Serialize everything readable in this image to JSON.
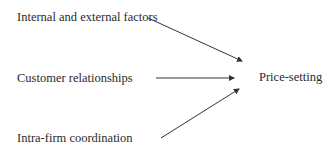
{
  "diagram": {
    "type": "flow",
    "nodes": [
      {
        "id": "internal",
        "label": "Internal and external factors"
      },
      {
        "id": "customer",
        "label": "Customer relationships"
      },
      {
        "id": "intra",
        "label": "Intra-firm coordination"
      },
      {
        "id": "price",
        "label": "Price-setting"
      }
    ],
    "edges": [
      {
        "from": "internal",
        "to": "price"
      },
      {
        "from": "customer",
        "to": "price"
      },
      {
        "from": "intra",
        "to": "price"
      }
    ],
    "colors": {
      "text": "#2a2a2a",
      "arrow": "#333333",
      "background": "#ffffff"
    }
  }
}
